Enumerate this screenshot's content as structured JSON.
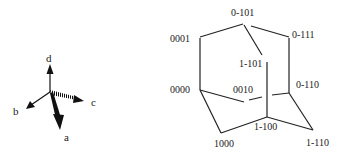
{
  "axes": {
    "labels": {
      "a": "a",
      "b": "b",
      "c": "c",
      "d": "d"
    }
  },
  "cage": {
    "vertices": {
      "v0_101": "0-101",
      "v0001": "0001",
      "v0_111": "0-111",
      "v1_101": "1-101",
      "v0000": "0000",
      "v0010": "0010",
      "v0_110": "0-110",
      "v1_100": "1-100",
      "v1000": "1000",
      "v1_110": "1-110"
    }
  }
}
